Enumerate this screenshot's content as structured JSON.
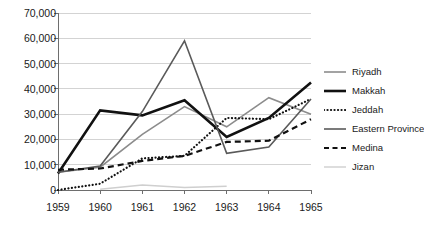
{
  "chart_data": {
    "type": "line",
    "title": "",
    "subtitle": "",
    "xlabel": "",
    "ylabel": "",
    "categories": [
      "1959",
      "1960",
      "1961",
      "1962",
      "1963",
      "1964",
      "1965"
    ],
    "x": [
      1959,
      1960,
      1961,
      1962,
      1963,
      1964,
      1965
    ],
    "ylim": [
      0,
      70000
    ],
    "yticks": [
      0,
      10000,
      20000,
      30000,
      40000,
      50000,
      60000,
      70000
    ],
    "ytick_labels": [
      "0",
      "10,000",
      "20,000",
      "30,000",
      "40,000",
      "50,000",
      "60,000",
      "70,000"
    ],
    "grid": "horizontal",
    "legend_position": "right",
    "series": [
      {
        "name": "Riyadh",
        "color": "#8c8c8c",
        "style": "solid",
        "width": 1.6,
        "values": [
          7000,
          9000,
          22000,
          33000,
          25000,
          36500,
          30000
        ]
      },
      {
        "name": "Makkah",
        "color": "#111111",
        "style": "solid",
        "width": 2.6,
        "values": [
          6500,
          31500,
          29500,
          35500,
          21000,
          28500,
          42500
        ]
      },
      {
        "name": "Jeddah",
        "color": "#111111",
        "style": "dotted",
        "width": 2.2,
        "values": [
          0,
          2500,
          12500,
          13500,
          28500,
          28000,
          36000
        ]
      },
      {
        "name": "Eastern Province",
        "color": "#5a5a5a",
        "style": "solid",
        "width": 1.6,
        "values": [
          7000,
          9500,
          31000,
          59000,
          14500,
          17000,
          36000
        ]
      },
      {
        "name": "Medina",
        "color": "#111111",
        "style": "dashed",
        "width": 2.2,
        "values": [
          8000,
          8500,
          11500,
          13500,
          19000,
          19500,
          28000
        ]
      },
      {
        "name": "Jizan",
        "color": "#cfcfcf",
        "style": "solid",
        "width": 1.4,
        "values": [
          null,
          300,
          2000,
          1000,
          1500,
          null,
          null
        ]
      }
    ]
  },
  "legend": {
    "items": [
      {
        "label": "Riyadh"
      },
      {
        "label": "Makkah"
      },
      {
        "label": "Jeddah"
      },
      {
        "label": "Eastern Province"
      },
      {
        "label": "Medina"
      },
      {
        "label": "Jizan"
      }
    ]
  },
  "colors": {
    "background": "#ffffff",
    "axis": "#6e6e6e",
    "grid": "#d3d3d3",
    "text": "#1a1a1a"
  }
}
